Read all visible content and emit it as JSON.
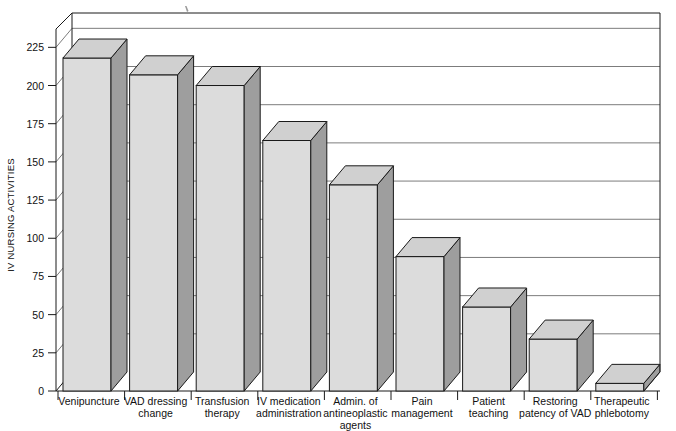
{
  "chart_data": {
    "type": "bar",
    "title": "",
    "subtitle": "",
    "xlabel": "",
    "ylabel": "IV NURSING ACTIVITIES",
    "ylim": [
      0,
      237
    ],
    "yticks": [
      0,
      25,
      50,
      75,
      100,
      125,
      150,
      175,
      200,
      225
    ],
    "ytick_labels": [
      "0",
      "25",
      "50",
      "75",
      "100",
      "125",
      "150",
      "175",
      "200",
      "225"
    ],
    "grid": true,
    "grid_axis": "y",
    "legend": false,
    "legend_position": "none",
    "style": "3d-bar",
    "categories": [
      "Venipuncture",
      "VAD dressing change",
      "Transfusion therapy",
      "IV medication administration",
      "Admin. of antineoplastic agents",
      "Pain management",
      "Patient teaching",
      "Restoring patency of VAD",
      "Therapeutic phlebotomy"
    ],
    "category_lines": [
      [
        "Venipuncture"
      ],
      [
        "VAD dressing",
        "change"
      ],
      [
        "Transfusion",
        "therapy"
      ],
      [
        "IV medication",
        "administration"
      ],
      [
        "Admin. of",
        "antineoplastic",
        "agents"
      ],
      [
        "Pain",
        "management"
      ],
      [
        "Patient",
        "teaching"
      ],
      [
        "Restoring",
        "patency of VAD"
      ],
      [
        "Therapeutic",
        "phlebotomy"
      ]
    ],
    "values": [
      218,
      207,
      200,
      164,
      135,
      88,
      55,
      34,
      5
    ],
    "colors": {
      "bar_front": "#dcdcdc",
      "bar_side": "#9e9e9e",
      "bar_top": "#d0d0d0",
      "outline": "#1a1a1a",
      "grid": "#5a5a5a",
      "axis": "#1a1a1a",
      "background": "#ffffff"
    }
  }
}
